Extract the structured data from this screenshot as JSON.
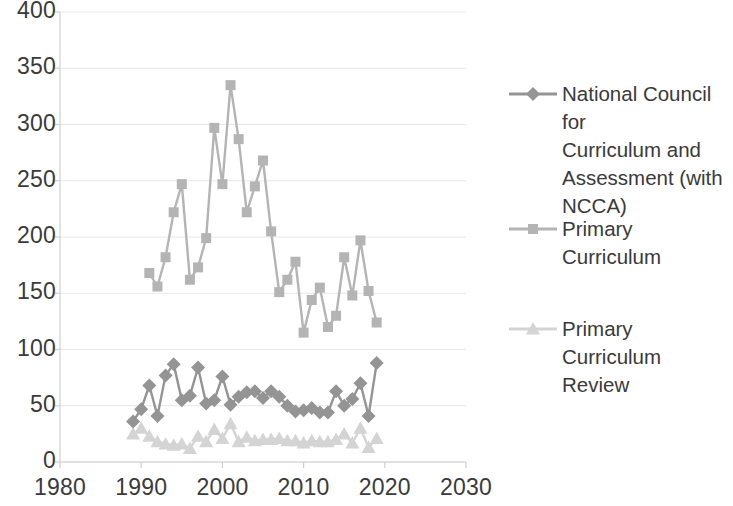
{
  "chart_data": {
    "type": "line",
    "title": "",
    "xlabel": "",
    "ylabel": "",
    "xlim": [
      1980,
      2030
    ],
    "ylim": [
      0,
      400
    ],
    "xticks": [
      1980,
      1990,
      2000,
      2010,
      2020,
      2030
    ],
    "yticks": [
      0,
      50,
      100,
      150,
      200,
      250,
      300,
      350,
      400
    ],
    "grid": "horizontal",
    "legend_position": "right",
    "x": [
      1989,
      1990,
      1991,
      1992,
      1993,
      1994,
      1995,
      1996,
      1997,
      1998,
      1999,
      2000,
      2001,
      2002,
      2003,
      2004,
      2005,
      2006,
      2007,
      2008,
      2009,
      2010,
      2011,
      2012,
      2013,
      2014,
      2015,
      2016,
      2017,
      2018,
      2019
    ],
    "series": [
      {
        "name": "National Council for Curriculum and Assessment (with NCCA)",
        "marker": "diamond",
        "color": "#949494",
        "values": [
          36,
          47,
          68,
          41,
          77,
          87,
          55,
          59,
          84,
          52,
          55,
          76,
          51,
          58,
          62,
          63,
          57,
          63,
          58,
          50,
          45,
          46,
          48,
          44,
          44,
          63,
          50,
          56,
          70,
          41,
          88
        ]
      },
      {
        "name": "Primary Curriculum",
        "marker": "square",
        "color": "#b4b4b4",
        "values": [
          null,
          null,
          168,
          156,
          182,
          222,
          247,
          162,
          173,
          199,
          297,
          247,
          335,
          287,
          222,
          245,
          268,
          205,
          151,
          162,
          178,
          115,
          144,
          155,
          120,
          130,
          182,
          148,
          197,
          152,
          124
        ]
      },
      {
        "name": "Primary Curriculum Review",
        "marker": "triangle",
        "color": "#d4d4d4",
        "values": [
          25,
          30,
          23,
          18,
          16,
          15,
          16,
          12,
          23,
          18,
          29,
          21,
          34,
          18,
          22,
          19,
          20,
          20,
          21,
          19,
          19,
          17,
          19,
          18,
          18,
          20,
          25,
          17,
          30,
          13,
          21
        ]
      }
    ]
  },
  "axes": {
    "y_tick_labels": [
      "400",
      "350",
      "300",
      "250",
      "200",
      "150",
      "100",
      "50",
      "0"
    ],
    "x_tick_labels": [
      "1980",
      "1990",
      "2000",
      "2010",
      "2020",
      "2030"
    ]
  },
  "legend": {
    "entries": [
      {
        "label": "National Council for\nCurriculum and\nAssessment (with\nNCCA)",
        "marker": "diamond",
        "color": "#949494"
      },
      {
        "label": "Primary Curriculum",
        "marker": "square",
        "color": "#b4b4b4"
      },
      {
        "label": "Primary Curriculum\nReview",
        "marker": "triangle",
        "color": "#d4d4d4"
      }
    ]
  },
  "colors": {
    "gridline": "#e8e8e8",
    "axis": "#d0d0d0",
    "text": "#3a3a3a"
  }
}
